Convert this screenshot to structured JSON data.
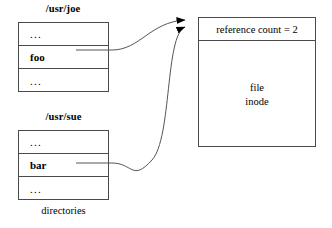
{
  "diagram": {
    "caption": "directories",
    "directories": [
      {
        "label": "/usr/joe",
        "rows": [
          {
            "text": "..."
          },
          {
            "text": "foo"
          },
          {
            "text": "..."
          }
        ]
      },
      {
        "label": "/usr/sue",
        "rows": [
          {
            "text": "..."
          },
          {
            "text": "bar"
          },
          {
            "text": "..."
          }
        ]
      }
    ],
    "inode": {
      "header": "reference count = 2",
      "body_line1": "file",
      "body_line2": "inode"
    },
    "links": [
      {
        "from": "foo",
        "to": "inode"
      },
      {
        "from": "bar",
        "to": "inode"
      }
    ],
    "colors": {
      "stroke": "#4a4a4a",
      "link": "#555555",
      "arrow": "#000000",
      "background": "#ffffff",
      "text": "#000000"
    }
  }
}
